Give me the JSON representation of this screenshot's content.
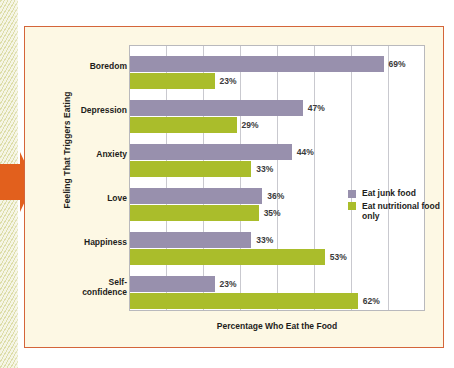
{
  "figure": {
    "background_color": "#fdf8e4",
    "border_color": "#d4653a",
    "callout_arrow_color": "#e2601d"
  },
  "chart_data": {
    "type": "bar",
    "orientation": "horizontal",
    "title": "",
    "xlabel": "Percentage Who Eat the Food",
    "ylabel": "Feeling That Triggers Eating",
    "xlim": [
      0,
      80
    ],
    "xticks": [
      0,
      10,
      20,
      30,
      40,
      50,
      60,
      70,
      80
    ],
    "grid": "vertical",
    "legend_position": "middle-right",
    "categories": [
      "Boredom",
      "Depression",
      "Anxiety",
      "Love",
      "Happiness",
      "Self-confidence"
    ],
    "series": [
      {
        "name": "Eat junk food",
        "color": "#9890ad",
        "values": [
          69,
          47,
          44,
          36,
          33,
          23
        ],
        "labels": [
          "69%",
          "47%",
          "44%",
          "36%",
          "33%",
          "23%"
        ]
      },
      {
        "name": "Eat nutritional food only",
        "color": "#aabd2b",
        "values": [
          23,
          29,
          33,
          35,
          53,
          62
        ],
        "labels": [
          "23%",
          "29%",
          "33%",
          "35%",
          "53%",
          "62%"
        ]
      }
    ]
  },
  "legend": {
    "items": [
      {
        "label": "Eat junk food",
        "color": "#9890ad"
      },
      {
        "label": "Eat nutritional food only",
        "color": "#aabd2b"
      }
    ]
  }
}
